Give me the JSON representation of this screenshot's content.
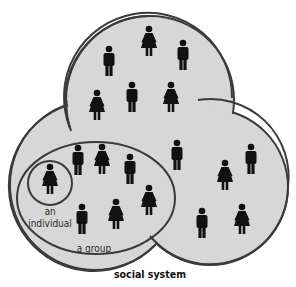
{
  "colors": {
    "background": "#ffffff",
    "circle_fill": "#d7d7d7",
    "outline": "#3a3a3a",
    "figure": "#111111",
    "label": "#2a2a2a"
  },
  "labels": {
    "individual_line1": "an",
    "individual_line2": "individual",
    "group": "a group",
    "system": "social system"
  },
  "figures": {
    "top_circle": [
      {
        "type": "man",
        "x": 109,
        "y": 49
      },
      {
        "type": "woman",
        "x": 149,
        "y": 29
      },
      {
        "type": "man",
        "x": 183,
        "y": 43
      },
      {
        "type": "woman",
        "x": 97,
        "y": 93
      },
      {
        "type": "man",
        "x": 132,
        "y": 85
      },
      {
        "type": "woman",
        "x": 171,
        "y": 85
      }
    ],
    "right_circle": [
      {
        "type": "man",
        "x": 177,
        "y": 143
      },
      {
        "type": "woman",
        "x": 225,
        "y": 163
      },
      {
        "type": "man",
        "x": 251,
        "y": 147
      },
      {
        "type": "man",
        "x": 202,
        "y": 211
      },
      {
        "type": "woman",
        "x": 242,
        "y": 207
      }
    ],
    "group": [
      {
        "type": "man",
        "x": 78,
        "y": 148
      },
      {
        "type": "woman",
        "x": 102,
        "y": 147
      },
      {
        "type": "man",
        "x": 130,
        "y": 157
      },
      {
        "type": "woman",
        "x": 149,
        "y": 188
      },
      {
        "type": "man",
        "x": 82,
        "y": 207
      },
      {
        "type": "woman",
        "x": 116,
        "y": 202
      }
    ],
    "individual": [
      {
        "type": "woman",
        "x": 50,
        "y": 167
      }
    ]
  }
}
